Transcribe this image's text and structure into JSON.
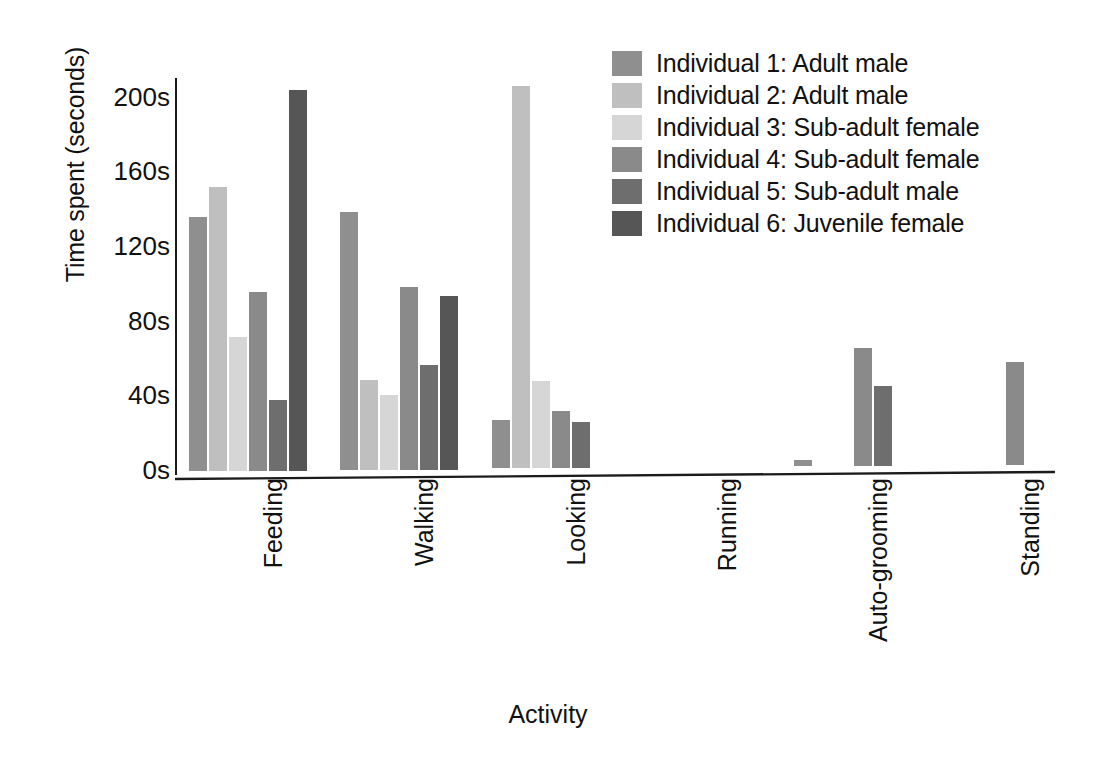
{
  "chart_data": {
    "type": "bar",
    "title": "",
    "xlabel": "Activity",
    "ylabel": "Time spent (seconds)",
    "categories": [
      "Feeding",
      "Walking",
      "Looking",
      "Running",
      "Auto-grooming",
      "Standing"
    ],
    "ytick_labels": [
      "0s",
      "40s",
      "80s",
      "120s",
      "160s",
      "200s"
    ],
    "ytick_values": [
      0,
      40,
      80,
      120,
      160,
      200
    ],
    "ylim": [
      0,
      210
    ],
    "grid": false,
    "legend_position": "top-right",
    "series": [
      {
        "name": "Individual 1: Adult male",
        "color": "#8f8f8f",
        "values": [
          136,
          138,
          26,
          0,
          3,
          0
        ]
      },
      {
        "name": "Individual 2: Adult male",
        "color": "#bfbfbf",
        "values": [
          152,
          48,
          205,
          0,
          0,
          0
        ]
      },
      {
        "name": "Individual 3: Sub-adult female",
        "color": "#d6d6d6",
        "values": [
          72,
          40,
          47,
          0,
          0,
          0
        ]
      },
      {
        "name": "Individual 4: Sub-adult female",
        "color": "#8a8a8a",
        "values": [
          96,
          98,
          31,
          0,
          63,
          55
        ]
      },
      {
        "name": "Individual 5: Sub-adult male",
        "color": "#6e6e6e",
        "values": [
          38,
          56,
          25,
          0,
          43,
          0
        ]
      },
      {
        "name": "Individual 6: Juvenile female",
        "color": "#565656",
        "values": [
          204,
          93,
          0,
          0,
          0,
          0
        ]
      }
    ]
  },
  "legend": {
    "items": [
      "Individual 1: Adult male",
      "Individual 2: Adult male",
      "Individual 3: Sub-adult female",
      "Individual 4: Sub-adult female",
      "Individual 5: Sub-adult male",
      "Individual 6: Juvenile female"
    ]
  },
  "axes": {
    "y_title": "Time spent (seconds)",
    "x_title": "Activity"
  }
}
